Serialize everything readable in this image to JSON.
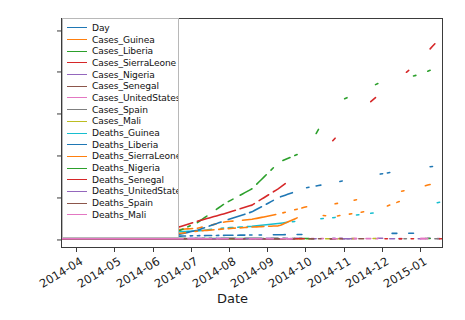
{
  "chart": {
    "type": "line",
    "title": "",
    "xlabel": "Date",
    "ylabel": "",
    "grid": false,
    "legend_position": "upper left",
    "ylim": [
      -400,
      10600
    ],
    "yticks": [
      "0",
      "2000",
      "4000",
      "6000",
      "8000",
      "10000"
    ],
    "ytick_values": [
      0,
      2000,
      4000,
      6000,
      8000,
      10000
    ],
    "xticks": [
      "2014-04",
      "2014-05",
      "2014-06",
      "2014-07",
      "2014-08",
      "2014-09",
      "2014-10",
      "2014-11",
      "2014-12",
      "2015-01"
    ],
    "legend_labels": [
      "Day",
      "Cases_Guinea",
      "Cases_Liberia",
      "Cases_SierraLeone",
      "Cases_Nigeria",
      "Cases_Senegal",
      "Cases_UnitedStates",
      "Cases_Spain",
      "Cases_Mali",
      "Deaths_Guinea",
      "Deaths_Liberia",
      "Deaths_SierraLeone",
      "Deaths_Nigeria",
      "Deaths_Senegal",
      "Deaths_UnitedStates",
      "Deaths_Spain",
      "Deaths_Mali"
    ],
    "colors": [
      "#1f77b4",
      "#ff7f0e",
      "#2ca02c",
      "#d62728",
      "#9467bd",
      "#8c564b",
      "#e377c2",
      "#7f7f7f",
      "#bcbd22",
      "#17becf",
      "#1f77b4",
      "#ff7f0e",
      "#2ca02c",
      "#d62728",
      "#9467bd",
      "#8c564b",
      "#e377c2"
    ]
  },
  "chart_data": {
    "type": "line",
    "title": "",
    "xlabel": "Date",
    "ylabel": "",
    "grid": false,
    "legend_position": "upper left",
    "ylim": [
      -400,
      10600
    ],
    "xlim": [
      "2014-03-22",
      "2015-01-14"
    ],
    "yticks": [
      0,
      2000,
      4000,
      6000,
      8000,
      10000
    ],
    "xtick_labels": [
      "2014-04",
      "2014-05",
      "2014-06",
      "2014-07",
      "2014-08",
      "2014-09",
      "2014-10",
      "2014-11",
      "2014-12",
      "2015-01"
    ],
    "x": [
      "2014-03-22",
      "2014-04-15",
      "2014-05-15",
      "2014-06-15",
      "2014-07-15",
      "2014-08-15",
      "2014-09-01",
      "2014-09-15",
      "2014-10-01",
      "2014-10-15",
      "2014-11-01",
      "2014-11-15",
      "2014-12-01",
      "2014-12-15",
      "2015-01-05"
    ],
    "series": [
      {
        "name": "Day",
        "color": "#1f77b4",
        "values": [
          0,
          24,
          54,
          85,
          115,
          146,
          163,
          177,
          193,
          207,
          224,
          238,
          254,
          268,
          289
        ]
      },
      {
        "name": "Cases_Guinea",
        "color": "#ff7f0e",
        "values": [
          49,
          197,
          248,
          390,
          410,
          510,
          812,
          936,
          1199,
          1540,
          1667,
          1919,
          2164,
          2416,
          2775
        ]
      },
      {
        "name": "Cases_Liberia",
        "color": "#2ca02c",
        "values": [
          8,
          27,
          13,
          51,
          196,
          786,
          1698,
          2407,
          3696,
          4249,
          6525,
          7082,
          7719,
          7862,
          8331
        ]
      },
      {
        "name": "Cases_SierraLeone",
        "color": "#d62728",
        "values": [
          6,
          12,
          16,
          97,
          442,
          848,
          1216,
          1620,
          2437,
          3410,
          4759,
          6190,
          7312,
          8356,
          9780
        ]
      },
      {
        "name": "Cases_Nigeria",
        "color": "#9467bd",
        "values": [
          0,
          0,
          0,
          0,
          12,
          15,
          21,
          20,
          20,
          20,
          20,
          20,
          20,
          20,
          20
        ]
      },
      {
        "name": "Cases_Senegal",
        "color": "#8c564b",
        "values": [
          0,
          0,
          0,
          0,
          0,
          1,
          1,
          1,
          1,
          1,
          1,
          1,
          1,
          1,
          1
        ]
      },
      {
        "name": "Cases_UnitedStates",
        "color": "#e377c2",
        "values": [
          0,
          0,
          0,
          0,
          0,
          0,
          0,
          0,
          1,
          4,
          4,
          4,
          4,
          4,
          4
        ]
      },
      {
        "name": "Cases_Spain",
        "color": "#7f7f7f",
        "values": [
          0,
          0,
          0,
          0,
          0,
          0,
          0,
          0,
          1,
          1,
          1,
          1,
          1,
          1,
          1
        ]
      },
      {
        "name": "Cases_Mali",
        "color": "#bcbd22",
        "values": [
          0,
          0,
          0,
          0,
          0,
          0,
          0,
          0,
          0,
          0,
          1,
          6,
          7,
          8,
          8
        ]
      },
      {
        "name": "Deaths_Guinea",
        "color": "#17becf",
        "values": [
          29,
          122,
          171,
          267,
          310,
          377,
          517,
          595,
          739,
          904,
          1018,
          1166,
          1327,
          1525,
          1781
        ]
      },
      {
        "name": "Deaths_Liberia",
        "color": "#1f77b4",
        "values": [
          6,
          13,
          11,
          34,
          116,
          413,
          871,
          1296,
          1998,
          2458,
          2697,
          2963,
          3177,
          3384,
          3538
        ]
      },
      {
        "name": "Deaths_SierraLeone",
        "color": "#ff7f0e",
        "values": [
          5,
          9,
          5,
          49,
          206,
          365,
          476,
          562,
          623,
          1200,
          1070,
          1267,
          1583,
          2085,
          2943
        ]
      },
      {
        "name": "Deaths_Nigeria",
        "color": "#2ca02c",
        "values": [
          0,
          0,
          0,
          0,
          4,
          6,
          8,
          8,
          8,
          8,
          8,
          8,
          8,
          8,
          8
        ]
      },
      {
        "name": "Deaths_Senegal",
        "color": "#d62728",
        "values": [
          0,
          0,
          0,
          0,
          0,
          0,
          0,
          0,
          0,
          0,
          0,
          0,
          0,
          0,
          0
        ]
      },
      {
        "name": "Deaths_UnitedStates",
        "color": "#9467bd",
        "values": [
          0,
          0,
          0,
          0,
          0,
          0,
          0,
          0,
          0,
          1,
          1,
          1,
          1,
          1,
          1
        ]
      },
      {
        "name": "Deaths_Spain",
        "color": "#8c564b",
        "values": [
          0,
          0,
          0,
          0,
          0,
          0,
          0,
          0,
          0,
          1,
          1,
          1,
          1,
          1,
          1
        ]
      },
      {
        "name": "Deaths_Mali",
        "color": "#e377c2",
        "values": [
          0,
          0,
          0,
          0,
          0,
          0,
          0,
          0,
          0,
          0,
          1,
          6,
          6,
          6,
          6
        ]
      }
    ]
  }
}
